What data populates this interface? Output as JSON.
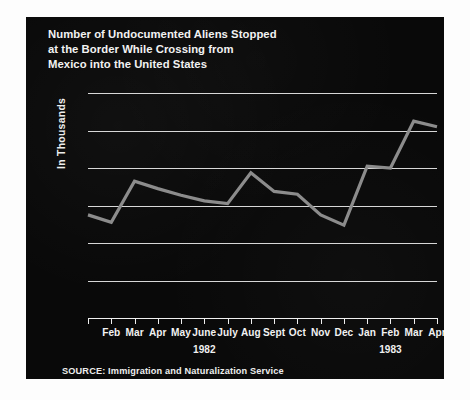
{
  "figure": {
    "panel_bg": "#090909",
    "page_bg": "#fdfdfd",
    "text_color": "#f2f2f2"
  },
  "title": {
    "line1": "Number of Undocumented Aliens Stopped",
    "line2": "at the Border While Crossing from",
    "line3": "Mexico into the United States"
  },
  "source": {
    "text": "SOURCE: Immigration and Naturalization Service"
  },
  "chart_data": {
    "type": "line",
    "title": "Number of Undocumented Aliens Stopped at the Border While Crossing from Mexico into the United States",
    "xlabel": "",
    "ylabel": "In Thousands",
    "ylim": [
      0,
      120
    ],
    "yticks": [
      0,
      20,
      40,
      60,
      80,
      100,
      120
    ],
    "grid": true,
    "legend": "none",
    "line_color": "#8c8c8c",
    "line_width": 3.2,
    "categories": [
      "",
      "Feb",
      "Mar",
      "Apr",
      "May",
      "June",
      "July",
      "Aug",
      "Sept",
      "Oct",
      "Nov",
      "Dec",
      "Jan",
      "Feb",
      "Mar",
      "Apr"
    ],
    "values": [
      55,
      51,
      73,
      69,
      65.5,
      62.5,
      61,
      77.5,
      67.5,
      66,
      55,
      49.5,
      81,
      80,
      105,
      102
    ],
    "year_groups": [
      {
        "label": "1982",
        "center_index": 5
      },
      {
        "label": "1983",
        "center_index": 13
      }
    ],
    "series": [
      {
        "name": "Undocumented aliens stopped (thousands)",
        "points": [
          {
            "month": "Jan",
            "year": 1982,
            "value": 55
          },
          {
            "month": "Feb",
            "year": 1982,
            "value": 51
          },
          {
            "month": "Mar",
            "year": 1982,
            "value": 73
          },
          {
            "month": "Apr",
            "year": 1982,
            "value": 69
          },
          {
            "month": "May",
            "year": 1982,
            "value": 65.5
          },
          {
            "month": "June",
            "year": 1982,
            "value": 62.5
          },
          {
            "month": "July",
            "year": 1982,
            "value": 61
          },
          {
            "month": "Aug",
            "year": 1982,
            "value": 77.5
          },
          {
            "month": "Sept",
            "year": 1982,
            "value": 67.5
          },
          {
            "month": "Oct",
            "year": 1982,
            "value": 66
          },
          {
            "month": "Nov",
            "year": 1982,
            "value": 55
          },
          {
            "month": "Dec",
            "year": 1982,
            "value": 49.5
          },
          {
            "month": "Jan",
            "year": 1983,
            "value": 81
          },
          {
            "month": "Feb",
            "year": 1983,
            "value": 80
          },
          {
            "month": "Mar",
            "year": 1983,
            "value": 105
          },
          {
            "month": "Apr",
            "year": 1983,
            "value": 102
          }
        ]
      }
    ]
  }
}
